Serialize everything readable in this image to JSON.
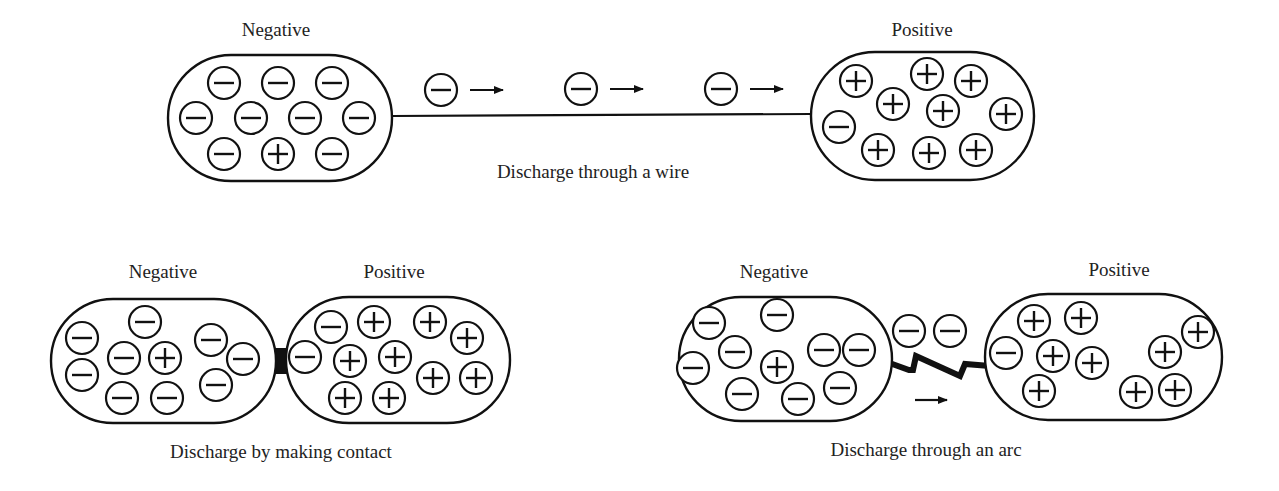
{
  "colors": {
    "stroke": "#111111",
    "background": "#ffffff",
    "text": "#222222"
  },
  "charge_radius": 16,
  "panels": [
    {
      "id": "wire",
      "caption": "Discharge through a wire",
      "caption_pos": [
        593,
        162
      ],
      "bodies": [
        {
          "label": "Negative",
          "label_pos": [
            276,
            20
          ],
          "rect": [
            168,
            55,
            224,
            126
          ],
          "rx": 63,
          "charges": [
            {
              "x": 224,
              "y": 83,
              "s": "-"
            },
            {
              "x": 278,
              "y": 83,
              "s": "-"
            },
            {
              "x": 332,
              "y": 83,
              "s": "-"
            },
            {
              "x": 196,
              "y": 118,
              "s": "-"
            },
            {
              "x": 251,
              "y": 118,
              "s": "-"
            },
            {
              "x": 305,
              "y": 118,
              "s": "-"
            },
            {
              "x": 359,
              "y": 118,
              "s": "-"
            },
            {
              "x": 224,
              "y": 154,
              "s": "-"
            },
            {
              "x": 278,
              "y": 154,
              "s": "+"
            },
            {
              "x": 332,
              "y": 154,
              "s": "-"
            }
          ]
        },
        {
          "label": "Positive",
          "label_pos": [
            922,
            20
          ],
          "rect": [
            811,
            52,
            223,
            128
          ],
          "rx": 64,
          "charges": [
            {
              "x": 856,
              "y": 81,
              "s": "+"
            },
            {
              "x": 927,
              "y": 74,
              "s": "+"
            },
            {
              "x": 971,
              "y": 81,
              "s": "+"
            },
            {
              "x": 893,
              "y": 104,
              "s": "+"
            },
            {
              "x": 943,
              "y": 111,
              "s": "+"
            },
            {
              "x": 1006,
              "y": 114,
              "s": "+"
            },
            {
              "x": 839,
              "y": 127,
              "s": "-"
            },
            {
              "x": 878,
              "y": 150,
              "s": "+"
            },
            {
              "x": 929,
              "y": 153,
              "s": "+"
            },
            {
              "x": 976,
              "y": 150,
              "s": "+"
            }
          ]
        }
      ],
      "wire": {
        "from": [
          392,
          116
        ],
        "to": [
          811,
          114
        ]
      },
      "flying_charges": [
        {
          "x": 441,
          "y": 90,
          "s": "-",
          "arrow": [
            470,
            90,
            503,
            90
          ]
        },
        {
          "x": 581,
          "y": 89,
          "s": "-",
          "arrow": [
            610,
            89,
            643,
            89
          ]
        },
        {
          "x": 721,
          "y": 89,
          "s": "-",
          "arrow": [
            750,
            89,
            783,
            89
          ]
        }
      ]
    },
    {
      "id": "contact",
      "caption": "Discharge by making contact",
      "caption_pos": [
        281,
        442
      ],
      "bodies": [
        {
          "label": "Negative",
          "label_pos": [
            163,
            262
          ],
          "rect": [
            51,
            299,
            225,
            124
          ],
          "rx": 62,
          "charges": [
            {
              "x": 82,
              "y": 338,
              "s": "-"
            },
            {
              "x": 145,
              "y": 322,
              "s": "-"
            },
            {
              "x": 211,
              "y": 340,
              "s": "-"
            },
            {
              "x": 124,
              "y": 358,
              "s": "-"
            },
            {
              "x": 165,
              "y": 358,
              "s": "+"
            },
            {
              "x": 243,
              "y": 359,
              "s": "-"
            },
            {
              "x": 82,
              "y": 375,
              "s": "-"
            },
            {
              "x": 216,
              "y": 385,
              "s": "-"
            },
            {
              "x": 122,
              "y": 398,
              "s": "-"
            },
            {
              "x": 167,
              "y": 398,
              "s": "-"
            }
          ]
        },
        {
          "label": "Positive",
          "label_pos": [
            394,
            262
          ],
          "rect": [
            286,
            297,
            224,
            126
          ],
          "rx": 63,
          "charges": [
            {
              "x": 331,
              "y": 327,
              "s": "-"
            },
            {
              "x": 374,
              "y": 322,
              "s": "+"
            },
            {
              "x": 430,
              "y": 322,
              "s": "+"
            },
            {
              "x": 467,
              "y": 338,
              "s": "+"
            },
            {
              "x": 305,
              "y": 357,
              "s": "-"
            },
            {
              "x": 350,
              "y": 361,
              "s": "+"
            },
            {
              "x": 395,
              "y": 357,
              "s": "+"
            },
            {
              "x": 433,
              "y": 378,
              "s": "+"
            },
            {
              "x": 476,
              "y": 378,
              "s": "+"
            },
            {
              "x": 345,
              "y": 398,
              "s": "+"
            },
            {
              "x": 389,
              "y": 398,
              "s": "+"
            }
          ]
        }
      ],
      "contact_bridge": [
        273,
        348,
        14,
        26
      ]
    },
    {
      "id": "arc",
      "caption": "Discharge through an arc",
      "caption_pos": [
        926,
        440
      ],
      "bodies": [
        {
          "label": "Negative",
          "label_pos": [
            774,
            262
          ],
          "rect": [
            679,
            297,
            213,
            124
          ],
          "rx": 62,
          "charges": [
            {
              "x": 709,
              "y": 323,
              "s": "-"
            },
            {
              "x": 777,
              "y": 315,
              "s": "-"
            },
            {
              "x": 735,
              "y": 352,
              "s": "-"
            },
            {
              "x": 824,
              "y": 350,
              "s": "-"
            },
            {
              "x": 859,
              "y": 350,
              "s": "-"
            },
            {
              "x": 693,
              "y": 368,
              "s": "-"
            },
            {
              "x": 777,
              "y": 367,
              "s": "+"
            },
            {
              "x": 742,
              "y": 394,
              "s": "-"
            },
            {
              "x": 840,
              "y": 388,
              "s": "-"
            },
            {
              "x": 798,
              "y": 399,
              "s": "-"
            }
          ]
        },
        {
          "label": "Positive",
          "label_pos": [
            1119,
            260
          ],
          "rect": [
            985,
            294,
            237,
            126
          ],
          "rx": 63,
          "charges": [
            {
              "x": 1034,
              "y": 321,
              "s": "+"
            },
            {
              "x": 1081,
              "y": 318,
              "s": "+"
            },
            {
              "x": 1198,
              "y": 332,
              "s": "+"
            },
            {
              "x": 1165,
              "y": 352,
              "s": "+"
            },
            {
              "x": 1006,
              "y": 353,
              "s": "-"
            },
            {
              "x": 1053,
              "y": 356,
              "s": "+"
            },
            {
              "x": 1092,
              "y": 363,
              "s": "+"
            },
            {
              "x": 1039,
              "y": 391,
              "s": "+"
            },
            {
              "x": 1136,
              "y": 392,
              "s": "+"
            },
            {
              "x": 1175,
              "y": 390,
              "s": "+"
            }
          ]
        }
      ],
      "arc_path": [
        [
          884,
          361
        ],
        [
          909,
          370
        ],
        [
          913,
          370
        ],
        [
          916,
          356
        ],
        [
          960,
          376
        ],
        [
          965,
          364
        ],
        [
          990,
          366
        ]
      ],
      "flying_charges": [
        {
          "x": 909,
          "y": 331,
          "s": "-"
        },
        {
          "x": 950,
          "y": 331,
          "s": "-"
        }
      ],
      "arrow": [
        915,
        400,
        947,
        400
      ]
    }
  ]
}
